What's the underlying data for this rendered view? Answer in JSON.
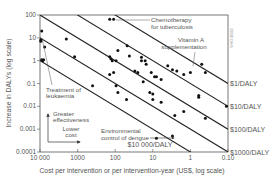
{
  "chart_data": {
    "type": "scatter",
    "title": "",
    "xlabel": "Cost per intervention or per intervention-year (US$, log scale)",
    "ylabel": "Increase in DALYs (log scale)",
    "x_scale": "log",
    "y_scale": "log",
    "x_reversed": true,
    "xlim": [
      10000,
      0.1
    ],
    "ylim": [
      0.0001,
      100
    ],
    "x_ticks": [
      10000,
      1000,
      100,
      10,
      1,
      0.1
    ],
    "x_tick_labels": [
      "10 000",
      "1000",
      "100",
      "10",
      "1",
      "0.10"
    ],
    "y_ticks": [
      100,
      10,
      1,
      0.1,
      0.01,
      0.001,
      0.0001
    ],
    "y_tick_labels": [
      "100",
      "10",
      "1",
      "0.1",
      "0.01",
      "0.001",
      "0.0001"
    ],
    "grid": false,
    "legend": null,
    "iso_cost_lines": [
      {
        "label": "$1/DALY",
        "cost_per_daly": 1
      },
      {
        "label": "$10/DALY",
        "cost_per_daly": 10
      },
      {
        "label": "$100/DALY",
        "cost_per_daly": 100
      },
      {
        "label": "$1000/DALY",
        "cost_per_daly": 1000
      },
      {
        "label": "$10 000/DALY",
        "cost_per_daly": 10000
      }
    ],
    "points": [
      {
        "x": 9000,
        "y": 20
      },
      {
        "x": 9500,
        "y": 8
      },
      {
        "x": 9500,
        "y": 7
      },
      {
        "x": 9000,
        "y": 1.1
      },
      {
        "x": 8500,
        "y": 1.0
      },
      {
        "x": 8000,
        "y": 1.1
      },
      {
        "x": 7500,
        "y": 4
      },
      {
        "x": 2000,
        "y": 9
      },
      {
        "x": 1200,
        "y": 1.5
      },
      {
        "x": 400,
        "y": 0.08
      },
      {
        "x": 140,
        "y": 65
      },
      {
        "x": 110,
        "y": 65
      },
      {
        "x": 85,
        "y": 2.8
      },
      {
        "x": 140,
        "y": 1.5
      },
      {
        "x": 130,
        "y": 1.2
      },
      {
        "x": 120,
        "y": 1.0
      },
      {
        "x": 95,
        "y": 1.0
      },
      {
        "x": 140,
        "y": 0.25
      },
      {
        "x": 110,
        "y": 0.3
      },
      {
        "x": 95,
        "y": 0.08
      },
      {
        "x": 85,
        "y": 0.04
      },
      {
        "x": 48,
        "y": 4.5
      },
      {
        "x": 42,
        "y": 1.6
      },
      {
        "x": 20,
        "y": 1.4
      },
      {
        "x": 20,
        "y": 1.0
      },
      {
        "x": 16,
        "y": 1.0
      },
      {
        "x": 15,
        "y": 0.7
      },
      {
        "x": 30,
        "y": 0.35
      },
      {
        "x": 25,
        "y": 0.3
      },
      {
        "x": 11,
        "y": 0.3
      },
      {
        "x": 9,
        "y": 0.2
      },
      {
        "x": 8,
        "y": 0.2
      },
      {
        "x": 6,
        "y": 0.15
      },
      {
        "x": 18,
        "y": 0.12
      },
      {
        "x": 12,
        "y": 0.04
      },
      {
        "x": 10,
        "y": 0.035
      },
      {
        "x": 50,
        "y": 0.02
      },
      {
        "x": 10,
        "y": 0.02
      },
      {
        "x": 6,
        "y": 0.015
      },
      {
        "x": 4,
        "y": 0.6
      },
      {
        "x": 3,
        "y": 0.4
      },
      {
        "x": 2.3,
        "y": 0.35
      },
      {
        "x": 1.5,
        "y": 0.25
      },
      {
        "x": 1.0,
        "y": 0.3
      },
      {
        "x": 0.5,
        "y": 0.7
      },
      {
        "x": 0.4,
        "y": 0.3
      },
      {
        "x": 0.6,
        "y": 0.03
      },
      {
        "x": 0.6,
        "y": 0.025
      },
      {
        "x": 1.5,
        "y": 0.006
      },
      {
        "x": 0.4,
        "y": 0.003
      },
      {
        "x": 0.11,
        "y": 0.01
      },
      {
        "x": 3,
        "y": 0.0005
      },
      {
        "x": 8.0,
        "y": 0.0004
      },
      {
        "x": 2.6,
        "y": 0.004
      }
    ],
    "annotations": [
      {
        "text_lines": [
          "Chemotherapy",
          "for tuberculosis"
        ],
        "points_to": {
          "x": 110,
          "y": 65
        }
      },
      {
        "text_lines": [
          "Vitamin A",
          "supplementation"
        ],
        "points_to": {
          "x": 0.5,
          "y": 0.6
        }
      },
      {
        "text_lines": [
          "Treatment of",
          "leukaemia"
        ],
        "points_to": {
          "x": 8500,
          "y": 7
        }
      },
      {
        "text_lines": [
          "Environmental",
          "control of dengue"
        ],
        "points_to": {
          "x": 3,
          "y": 0.0005
        }
      },
      {
        "text_lines": [
          "Greater",
          "effectiveness"
        ],
        "type": "arrow-up"
      },
      {
        "text_lines": [
          "Lower",
          "cost"
        ],
        "type": "arrow-right"
      }
    ],
    "credit": "WHO 99302"
  },
  "labels": {
    "y_axis_title": "Increase in DALYs (log scale)",
    "x_axis_title": "Cost per intervention or per intervention-year (US$, log scale)",
    "chemo_1": "Chemotherapy",
    "chemo_2": "for tuberculosis",
    "vita_1": "Vitamin A",
    "vita_2": "supplementation",
    "leuk_1": "Treatment of",
    "leuk_2": "leukaemia",
    "dengue_1": "Environmental",
    "dengue_2": "control of dengue",
    "greater_1": "Greater",
    "greater_2": "effectiveness",
    "lower_1": "Lower",
    "lower_2": "cost",
    "credit": "WHO 99302"
  }
}
